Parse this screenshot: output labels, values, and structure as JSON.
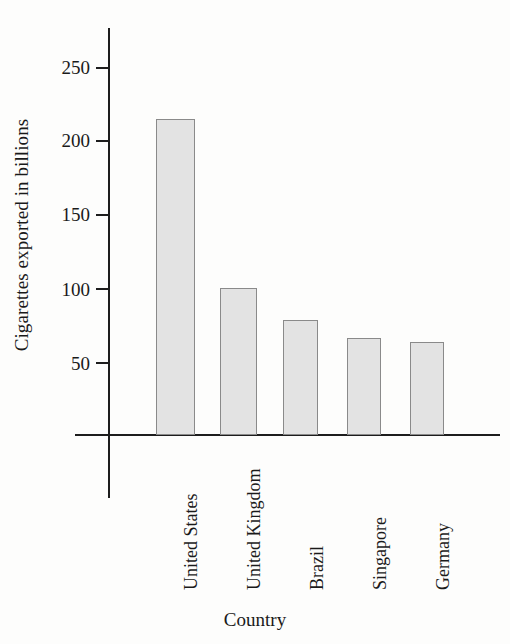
{
  "chart_data": {
    "type": "bar",
    "title": "",
    "xlabel": "Country",
    "ylabel": "Cigarettes exported in billions",
    "categories": [
      "United States",
      "United Kingdom",
      "Brazil",
      "Singapore",
      "Germany"
    ],
    "values": [
      215,
      100,
      78,
      66,
      63
    ],
    "ylim": [
      0,
      270
    ],
    "yticks": [
      50,
      100,
      150,
      200,
      250
    ],
    "ytick_labels": [
      "50",
      "100",
      "150",
      "200",
      "250"
    ],
    "grid": false,
    "legend": false,
    "series": [
      {
        "name": "Cigarettes exported in billions",
        "values": [
          215,
          100,
          78,
          66,
          63
        ]
      }
    ],
    "colors": {
      "bar_fill": "#e3e3e3",
      "bar_border": "#8a8a8a",
      "axis": "#1d1d1d",
      "text": "#1a1a1a",
      "background": "#fdfdfc"
    }
  }
}
